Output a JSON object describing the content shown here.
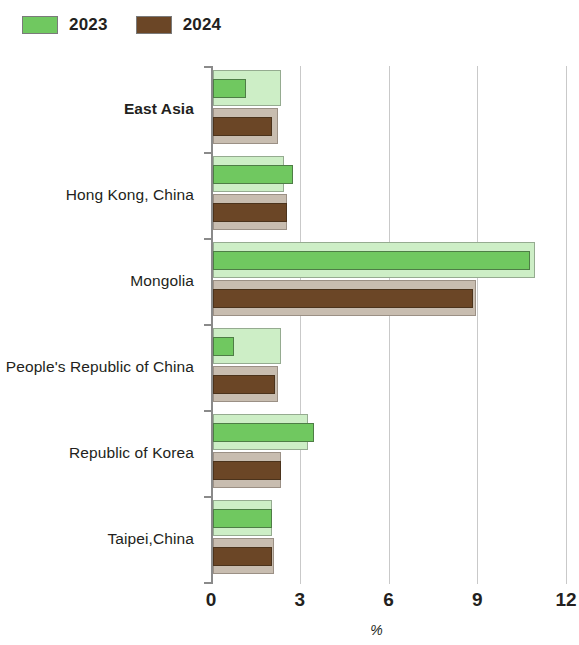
{
  "legend": {
    "items": [
      {
        "label": "2023",
        "color": "#70c860"
      },
      {
        "label": "2024",
        "color": "#6b4626"
      }
    ]
  },
  "axis": {
    "x_title": "%",
    "x_ticks": [
      "0",
      "3",
      "6",
      "9",
      "12"
    ]
  },
  "chart_data": {
    "type": "bar",
    "orientation": "horizontal",
    "title": "",
    "subtitle": "",
    "xlabel": "%",
    "ylabel": "",
    "xlim": [
      0,
      12
    ],
    "xticks": [
      0,
      3,
      6,
      9,
      12
    ],
    "grid": "vertical",
    "legend_position": "top-left",
    "categories": [
      "East Asia",
      "Hong Kong, China",
      "Mongolia",
      "People's Republic of China",
      "Republic of Korea",
      "Taipei,China"
    ],
    "emphasized_categories": [
      "East Asia"
    ],
    "series": [
      {
        "name": "2023",
        "color": "#70c860",
        "values": [
          1.1,
          2.7,
          10.7,
          0.7,
          3.4,
          2.0
        ]
      },
      {
        "name": "2024",
        "color": "#6b4626",
        "values": [
          2.0,
          2.5,
          8.8,
          2.1,
          2.3,
          2.0
        ]
      }
    ],
    "depth_bands": {
      "note": "pale 3D extrusion band drawn behind each value bar",
      "2023": [
        2.3,
        2.4,
        10.9,
        2.3,
        3.2,
        2.0
      ],
      "2024": [
        2.2,
        2.5,
        8.9,
        2.2,
        2.3,
        2.05
      ]
    }
  }
}
